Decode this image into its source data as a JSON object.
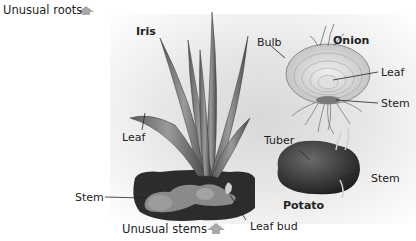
{
  "sections": {
    "roots_title": "Unusual roots",
    "stems_title": "Unusual stems"
  },
  "plants": {
    "iris": {
      "name": "Iris",
      "labels": {
        "leaf": "Leaf",
        "stem": "Stem",
        "leaf_bud": "Leaf bud"
      }
    },
    "onion": {
      "name": "Onion",
      "labels": {
        "bulb": "Bulb",
        "leaf": "Leaf",
        "stem": "Stem"
      }
    },
    "potato": {
      "name": "Potato",
      "labels": {
        "tuber": "Tuber",
        "stem": "Stem"
      }
    }
  },
  "colors": {
    "arrow": "#a8a8a8",
    "soil": "#2a2a2a",
    "leaf": "#7a7a7a",
    "potato": "#3a3a3a"
  }
}
